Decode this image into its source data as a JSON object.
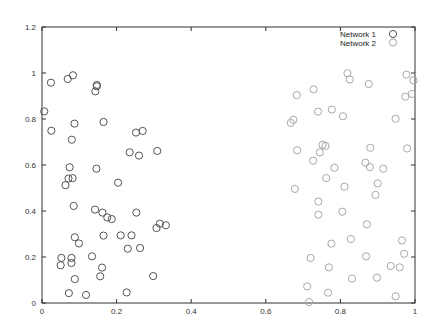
{
  "chart_data": {
    "type": "scatter",
    "title": "",
    "xlabel": "",
    "ylabel": "",
    "xlim": [
      0,
      1
    ],
    "ylim": [
      0,
      1.2
    ],
    "xticks": [
      "0",
      "0.2",
      "0.4",
      "0.6",
      "0.8",
      "1"
    ],
    "yticks": [
      "0",
      "0.2",
      "0.4",
      "0.6",
      "0.8",
      "1",
      "1.2"
    ],
    "grid": false,
    "legend_position": "top-right",
    "marker": "open-circle",
    "series": [
      {
        "name": "Network 1",
        "color": "#555555",
        "points": [
          [
            0.006,
            0.833
          ],
          [
            0.024,
            0.958
          ],
          [
            0.025,
            0.749
          ],
          [
            0.069,
            0.974
          ],
          [
            0.083,
            0.99
          ],
          [
            0.147,
            0.948
          ],
          [
            0.143,
            0.92
          ],
          [
            0.147,
            0.942
          ],
          [
            0.087,
            0.78
          ],
          [
            0.165,
            0.787
          ],
          [
            0.08,
            0.71
          ],
          [
            0.252,
            0.741
          ],
          [
            0.27,
            0.748
          ],
          [
            0.235,
            0.655
          ],
          [
            0.26,
            0.641
          ],
          [
            0.309,
            0.661
          ],
          [
            0.074,
            0.59
          ],
          [
            0.146,
            0.584
          ],
          [
            0.071,
            0.541
          ],
          [
            0.082,
            0.543
          ],
          [
            0.063,
            0.512
          ],
          [
            0.204,
            0.523
          ],
          [
            0.085,
            0.422
          ],
          [
            0.142,
            0.406
          ],
          [
            0.162,
            0.393
          ],
          [
            0.175,
            0.372
          ],
          [
            0.187,
            0.365
          ],
          [
            0.253,
            0.393
          ],
          [
            0.307,
            0.326
          ],
          [
            0.316,
            0.345
          ],
          [
            0.332,
            0.338
          ],
          [
            0.088,
            0.286
          ],
          [
            0.099,
            0.259
          ],
          [
            0.165,
            0.293
          ],
          [
            0.211,
            0.294
          ],
          [
            0.24,
            0.294
          ],
          [
            0.23,
            0.236
          ],
          [
            0.263,
            0.239
          ],
          [
            0.052,
            0.196
          ],
          [
            0.05,
            0.164
          ],
          [
            0.079,
            0.196
          ],
          [
            0.079,
            0.174
          ],
          [
            0.134,
            0.203
          ],
          [
            0.161,
            0.154
          ],
          [
            0.156,
            0.116
          ],
          [
            0.088,
            0.104
          ],
          [
            0.298,
            0.117
          ],
          [
            0.072,
            0.043
          ],
          [
            0.118,
            0.035
          ],
          [
            0.227,
            0.046
          ]
        ]
      },
      {
        "name": "Network 2",
        "color": "#a8a8a8",
        "points": [
          [
            0.819,
            0.999
          ],
          [
            0.825,
            0.972
          ],
          [
            0.876,
            0.952
          ],
          [
            0.977,
            0.993
          ],
          [
            0.996,
            0.968
          ],
          [
            0.992,
            0.909
          ],
          [
            0.974,
            0.897
          ],
          [
            0.728,
            0.929
          ],
          [
            0.683,
            0.904
          ],
          [
            0.74,
            0.832
          ],
          [
            0.777,
            0.841
          ],
          [
            0.807,
            0.812
          ],
          [
            0.948,
            0.801
          ],
          [
            0.674,
            0.797
          ],
          [
            0.667,
            0.783
          ],
          [
            0.684,
            0.664
          ],
          [
            0.752,
            0.688
          ],
          [
            0.76,
            0.683
          ],
          [
            0.745,
            0.655
          ],
          [
            0.88,
            0.675
          ],
          [
            0.979,
            0.672
          ],
          [
            0.727,
            0.619
          ],
          [
            0.784,
            0.588
          ],
          [
            0.867,
            0.61
          ],
          [
            0.879,
            0.591
          ],
          [
            0.915,
            0.584
          ],
          [
            0.762,
            0.543
          ],
          [
            0.811,
            0.506
          ],
          [
            0.9,
            0.52
          ],
          [
            0.894,
            0.47
          ],
          [
            0.678,
            0.496
          ],
          [
            0.741,
            0.441
          ],
          [
            0.741,
            0.384
          ],
          [
            0.805,
            0.397
          ],
          [
            0.871,
            0.342
          ],
          [
            0.828,
            0.278
          ],
          [
            0.776,
            0.258
          ],
          [
            0.965,
            0.272
          ],
          [
            0.72,
            0.196
          ],
          [
            0.869,
            0.203
          ],
          [
            0.971,
            0.214
          ],
          [
            0.769,
            0.155
          ],
          [
            0.935,
            0.161
          ],
          [
            0.959,
            0.155
          ],
          [
            0.831,
            0.106
          ],
          [
            0.898,
            0.11
          ],
          [
            0.711,
            0.072
          ],
          [
            0.767,
            0.045
          ],
          [
            0.716,
            0.004
          ],
          [
            0.948,
            0.029
          ]
        ]
      }
    ]
  },
  "legend": {
    "items": [
      {
        "label": "Network 1",
        "color": "#555555"
      },
      {
        "label": "Network 2",
        "color": "#a8a8a8"
      }
    ]
  }
}
